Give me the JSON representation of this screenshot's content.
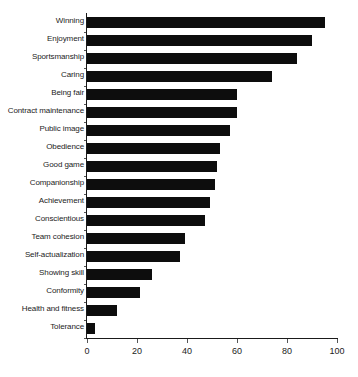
{
  "chart_data": {
    "type": "bar",
    "orientation": "horizontal",
    "title": "",
    "subtitle": "",
    "xlabel": "",
    "ylabel": "",
    "xlim": [
      0,
      100
    ],
    "xticks": [
      0,
      20,
      40,
      60,
      80,
      100
    ],
    "grid": false,
    "legend": null,
    "bar_color": "#0d0d0d",
    "axis_color": "#1a1a1a",
    "categories": [
      "Winning",
      "Enjoyment",
      "Sportsmanship",
      "Caring",
      "Being fair",
      "Contract maintenance",
      "Public image",
      "Obedience",
      "Good game",
      "Companionship",
      "Achievement",
      "Conscientious",
      "Team cohesion",
      "Self-actualization",
      "Showing skill",
      "Conformity",
      "Health and fitness",
      "Tolerance"
    ],
    "values": [
      95,
      90,
      84,
      74,
      60,
      60,
      57,
      53,
      52,
      51,
      49,
      47,
      39,
      37,
      26,
      21,
      12,
      3
    ]
  }
}
